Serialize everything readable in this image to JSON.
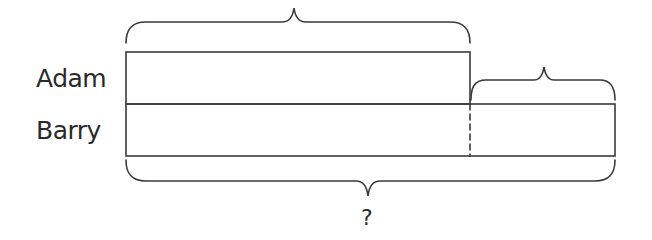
{
  "diagram": {
    "type": "bar-model",
    "rows": [
      {
        "label": "Adam"
      },
      {
        "label": "Barry"
      }
    ],
    "question_label": "?",
    "stroke_color": "#3a3a3a"
  }
}
